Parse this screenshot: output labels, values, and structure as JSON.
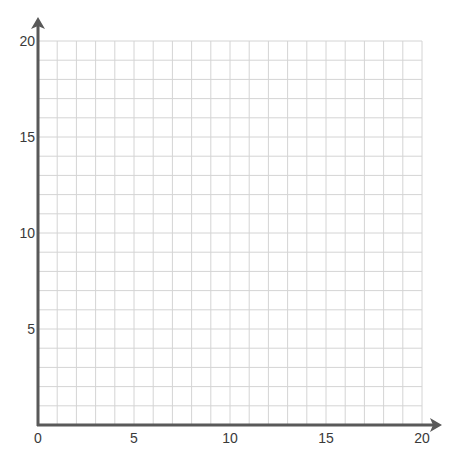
{
  "diagram": {
    "type": "coordinate-grid",
    "title": "",
    "x_axis": {
      "min": 0,
      "max": 20,
      "major_step": 5,
      "minor_step": 1,
      "tick_labels": [
        "0",
        "5",
        "10",
        "15",
        "20"
      ]
    },
    "y_axis": {
      "min": 0,
      "max": 20,
      "major_step": 5,
      "minor_step": 1,
      "tick_labels": [
        "5",
        "10",
        "15",
        "20"
      ]
    },
    "grid": {
      "on": true,
      "cells_x": 20,
      "cells_y": 20
    },
    "colors": {
      "axis": "#595959",
      "grid": "#d4d4d4",
      "label": "#3a3a3a",
      "background": "#ffffff"
    }
  }
}
